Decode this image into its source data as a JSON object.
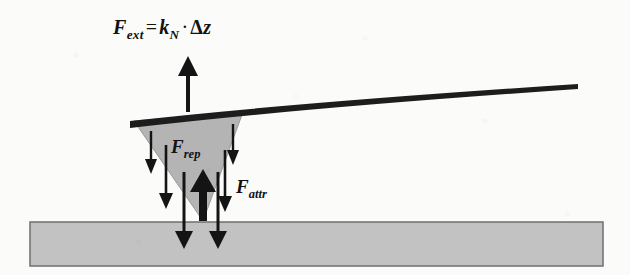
{
  "figure": {
    "type": "diagram",
    "background_color": "#fbfbfa"
  },
  "equation": {
    "force_symbol": "F",
    "force_subscript": "ext",
    "equals": "=",
    "spring_symbol": "k",
    "spring_subscript": "N",
    "dot": "·",
    "delta": "Δ",
    "displacement": "z",
    "full_text": "F_ext = k_N · Δz"
  },
  "labels": {
    "repulsive": {
      "symbol": "F",
      "subscript": "rep",
      "full_text": "F_rep"
    },
    "attractive": {
      "symbol": "F",
      "subscript": "attr",
      "full_text": "F_attr"
    }
  },
  "colors": {
    "ink": "#141414",
    "cantilever": "#1d1d1d",
    "tip_fill": "#b4b4b4",
    "tip_stroke": "#8e8e8e",
    "substrate_fill": "#c2c2c2",
    "substrate_stroke": "#6f6f6f",
    "background": "#fbfbfa"
  },
  "elements": {
    "cantilever": {
      "name": "cantilever-beam",
      "description": "bent dark beam rising left to right",
      "start": [
        130,
        127
      ],
      "end": [
        578,
        88
      ],
      "thickness": 7
    },
    "tip": {
      "name": "afm-tip",
      "description": "gray triangular probe tip",
      "top_left": [
        134,
        122
      ],
      "top_right": [
        243,
        113
      ],
      "apex": [
        203,
        221
      ]
    },
    "substrate": {
      "name": "sample-substrate",
      "x": 30,
      "y": 222,
      "width": 573,
      "height": 44
    },
    "external_force_arrow": {
      "name": "f-ext-arrow",
      "direction": "up",
      "x": 188,
      "y_head": 57,
      "y_tail": 112
    },
    "repulsive_arrow": {
      "name": "f-rep-arrow",
      "direction": "up",
      "x": 203,
      "y_head": 171,
      "y_tail": 221,
      "thick": true
    },
    "attractive_arrows": [
      {
        "name": "f-attr-arrow-outer-left",
        "direction": "down",
        "x": 151,
        "y_start": 131,
        "y_end": 172
      },
      {
        "name": "f-attr-arrow-mid-left",
        "direction": "down",
        "x": 166,
        "y_start": 145,
        "y_end": 207
      },
      {
        "name": "f-attr-arrow-inner-left",
        "direction": "down",
        "x": 184,
        "y_start": 172,
        "y_end": 247
      },
      {
        "name": "f-attr-arrow-inner-right",
        "direction": "down",
        "x": 217,
        "y_start": 172,
        "y_end": 247
      },
      {
        "name": "f-attr-arrow-mid-right",
        "direction": "down",
        "x": 224,
        "y_start": 150,
        "y_end": 211
      },
      {
        "name": "f-attr-arrow-outer-right",
        "direction": "down",
        "x": 233,
        "y_start": 124,
        "y_end": 163
      }
    ]
  }
}
